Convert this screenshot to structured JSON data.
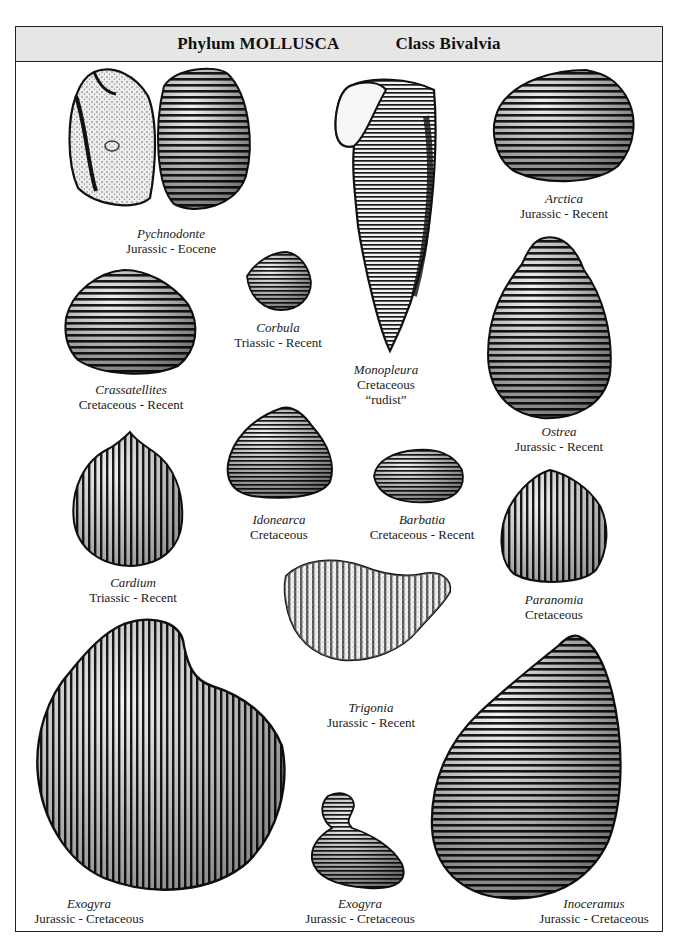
{
  "header": {
    "phylum": "Phylum MOLLUSCA",
    "class": "Class Bivalvia"
  },
  "specimens": [
    {
      "genus": "Pychnodonte",
      "range": "Jurassic - Eocene"
    },
    {
      "genus": "Arctica",
      "range": "Jurassic - Recent"
    },
    {
      "genus": "Corbula",
      "range": "Triassic - Recent"
    },
    {
      "genus": "Monopleura",
      "range": "Cretaceous",
      "note": "“rudist”"
    },
    {
      "genus": "Crassatellites",
      "range": "Cretaceous - Recent"
    },
    {
      "genus": "Ostrea",
      "range": "Jurassic - Recent"
    },
    {
      "genus": "Idonearca",
      "range": "Cretaceous"
    },
    {
      "genus": "Barbatia",
      "range": "Cretaceous - Recent"
    },
    {
      "genus": "Cardium",
      "range": "Triassic - Recent"
    },
    {
      "genus": "Paranomia",
      "range": "Cretaceous"
    },
    {
      "genus": "Trigonia",
      "range": "Jurassic - Recent"
    },
    {
      "genus": "Exogyra",
      "range": "Jurassic - Cretaceous"
    },
    {
      "genus": "Exogyra",
      "range": "Jurassic - Cretaceous"
    },
    {
      "genus": "Inoceramus",
      "range": "Jurassic - Cretaceous"
    }
  ],
  "colors": {
    "ink": "#111111",
    "header_bg": "#e6e6e6",
    "paper": "#ffffff"
  }
}
